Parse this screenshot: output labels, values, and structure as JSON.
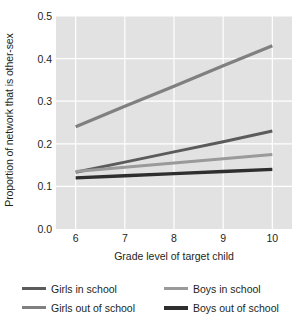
{
  "chart_data": {
    "type": "line",
    "title": "",
    "xlabel": "Grade level of target child",
    "ylabel": "Proportion of network that is other-sex",
    "x": [
      6,
      7,
      8,
      9,
      10
    ],
    "xlim": [
      5.6,
      10.4
    ],
    "ylim": [
      0.0,
      0.5
    ],
    "xticks": [
      "6",
      "7",
      "8",
      "9",
      "10"
    ],
    "yticks": [
      "0.0",
      "0.1",
      "0.2",
      "0.3",
      "0.4",
      "0.5"
    ],
    "ytick_values": [
      0.0,
      0.1,
      0.2,
      0.3,
      0.4,
      0.5
    ],
    "grid": true,
    "grid_color": "#ffffff",
    "plot_background": "#e2e2e2",
    "legend_position": "bottom",
    "legend_columns": 2,
    "series": [
      {
        "name": "Girls in school",
        "color": "#5b5b5b",
        "width": 3.0,
        "values": [
          0.133,
          0.157,
          0.181,
          0.205,
          0.23
        ]
      },
      {
        "name": "Boys in school",
        "color": "#9a9a9a",
        "width": 3.0,
        "values": [
          0.135,
          0.145,
          0.155,
          0.165,
          0.175
        ]
      },
      {
        "name": "Girls out of school",
        "color": "#808080",
        "width": 3.2,
        "values": [
          0.24,
          0.288,
          0.335,
          0.383,
          0.43
        ]
      },
      {
        "name": "Boys out of school",
        "color": "#2e2e2e",
        "width": 3.4,
        "values": [
          0.12,
          0.125,
          0.13,
          0.135,
          0.14
        ]
      }
    ]
  },
  "legend": {
    "items": [
      {
        "label": "Girls in school",
        "color": "#5b5b5b",
        "icon": "line-swatch-icon"
      },
      {
        "label": "Boys in school",
        "color": "#9a9a9a",
        "icon": "line-swatch-icon"
      },
      {
        "label": "Girls out of school",
        "color": "#808080",
        "icon": "line-swatch-icon"
      },
      {
        "label": "Boys out of school",
        "color": "#2e2e2e",
        "icon": "line-swatch-icon"
      }
    ]
  }
}
